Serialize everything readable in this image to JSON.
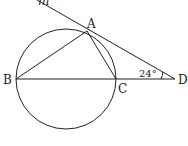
{
  "diagram": {
    "type": "geometry",
    "stroke_color": "#222222",
    "circle": {
      "cx": 66,
      "cy": 79,
      "r": 50
    },
    "points": {
      "A": {
        "label": "A",
        "x": 87,
        "y": 31
      },
      "B": {
        "label": "B",
        "x": 16,
        "y": 79
      },
      "C": {
        "label": "C",
        "x": 116,
        "y": 79
      },
      "D": {
        "label": "D",
        "x": 175,
        "y": 79
      }
    },
    "line_m": {
      "label": "m"
    },
    "angle": {
      "at": "D",
      "value": "24°"
    },
    "segments": [
      "AB",
      "AC",
      "BD",
      "AD (tangent m)"
    ]
  }
}
